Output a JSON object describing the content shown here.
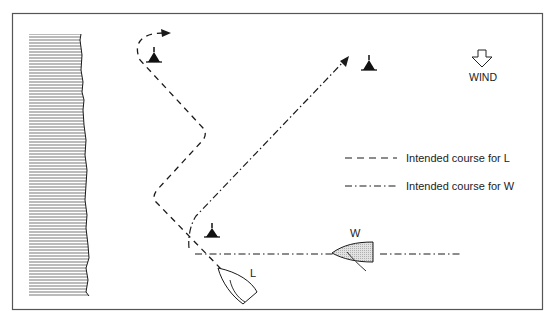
{
  "diagram": {
    "wind_label": "WIND",
    "legend": [
      {
        "style": "dashed",
        "label": "Intended course for L"
      },
      {
        "style": "dash-dot",
        "label": "Intended course for W"
      }
    ],
    "boats": [
      {
        "id": "L",
        "label": "L",
        "fill": "#ffffff"
      },
      {
        "id": "W",
        "label": "W",
        "fill": "#d9d9d9"
      }
    ],
    "marks": [
      "mark-top-left",
      "mark-top-right",
      "mark-bottom"
    ],
    "colors": {
      "ink": "#1a1a1a",
      "frame": "#555555",
      "shore": "#888888"
    }
  }
}
